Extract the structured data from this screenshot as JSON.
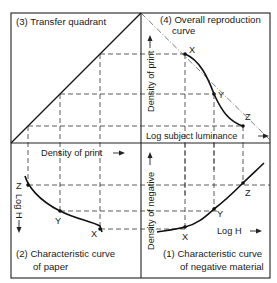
{
  "figure": {
    "type": "four-quadrant tone reproduction diagram",
    "quadrants": {
      "q1": {
        "title_line1": "(1) Characteristic curve",
        "title_line2": "of negative material",
        "x_axis_label": "Log H",
        "y_axis_label": "Density of negative",
        "points": [
          "X",
          "Y",
          "Z"
        ]
      },
      "q2": {
        "title_line1": "(2) Characteristic curve",
        "title_line2": "of paper",
        "x_axis_label": "Density of print",
        "y_axis_label": "Log H",
        "points": [
          "Z",
          "Y",
          "X"
        ]
      },
      "q3": {
        "title": "(3) Transfer quadrant"
      },
      "q4": {
        "title_line1": "(4) Overall reproduction",
        "title_line2": "curve",
        "x_axis_label": "Log subject luminance",
        "y_axis_label": "Density of print",
        "points": [
          "X",
          "Y",
          "Z"
        ]
      }
    },
    "colors": {
      "line": "#111111",
      "background": "#ffffff"
    }
  }
}
